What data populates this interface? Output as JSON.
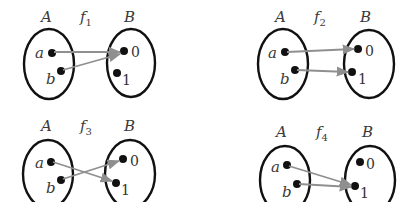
{
  "colors": {
    "set_outline": "#111111",
    "arrow": "#8f8f8f",
    "dot": "#111111",
    "text": "#3a3a3a"
  },
  "diagrams": [
    {
      "name": "f",
      "subscript": "1",
      "domain_label": "A",
      "codomain_label": "B",
      "domain_elements": [
        "a",
        "b"
      ],
      "codomain_elements": [
        "0",
        "1"
      ],
      "mappings": [
        {
          "from": "a",
          "to": "0"
        },
        {
          "from": "b",
          "to": "0"
        }
      ]
    },
    {
      "name": "f",
      "subscript": "2",
      "domain_label": "A",
      "codomain_label": "B",
      "domain_elements": [
        "a",
        "b"
      ],
      "codomain_elements": [
        "0",
        "1"
      ],
      "mappings": [
        {
          "from": "a",
          "to": "0"
        },
        {
          "from": "b",
          "to": "1"
        }
      ]
    },
    {
      "name": "f",
      "subscript": "3",
      "domain_label": "A",
      "codomain_label": "B",
      "domain_elements": [
        "a",
        "b"
      ],
      "codomain_elements": [
        "0",
        "1"
      ],
      "mappings": [
        {
          "from": "a",
          "to": "1"
        },
        {
          "from": "b",
          "to": "0"
        }
      ]
    },
    {
      "name": "f",
      "subscript": "4",
      "domain_label": "A",
      "codomain_label": "B",
      "domain_elements": [
        "a",
        "b"
      ],
      "codomain_elements": [
        "0",
        "1"
      ],
      "mappings": [
        {
          "from": "a",
          "to": "1"
        },
        {
          "from": "b",
          "to": "1"
        }
      ]
    }
  ]
}
